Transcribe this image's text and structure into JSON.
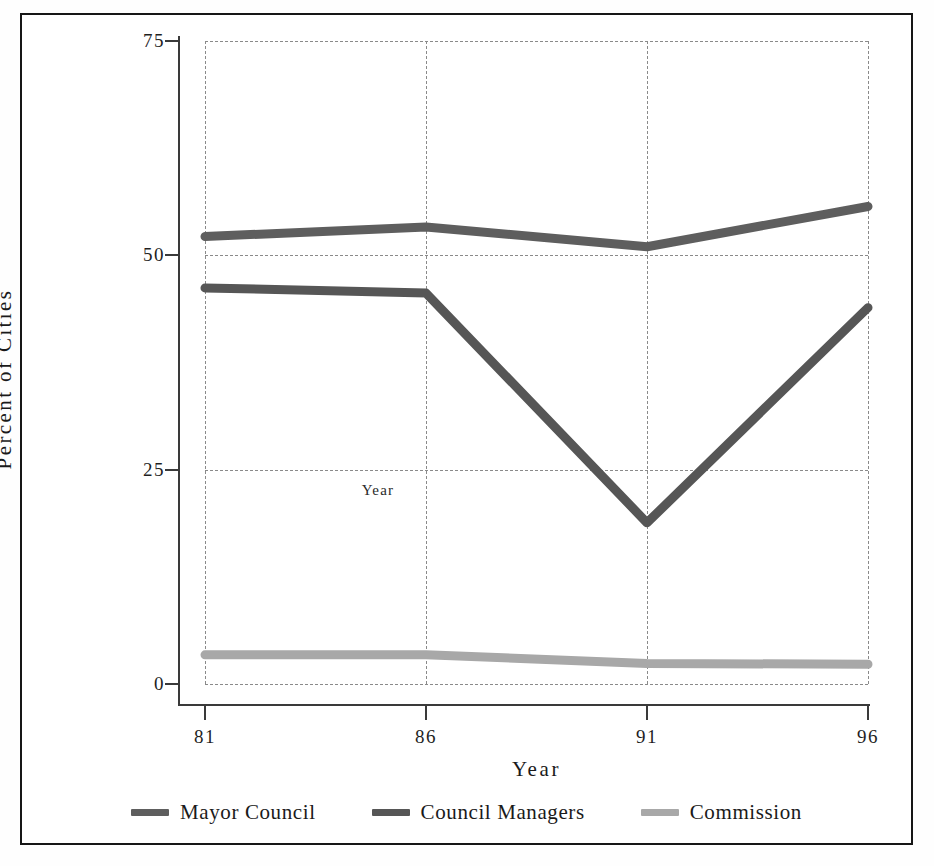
{
  "chart_data": {
    "type": "line",
    "title": "",
    "xlabel": "Year",
    "ylabel": "Percent of Cities",
    "categories": [
      "81",
      "86",
      "91",
      "96"
    ],
    "x": [
      81,
      86,
      91,
      96
    ],
    "xlim": [
      81,
      96
    ],
    "ylim": [
      0,
      75
    ],
    "yticks": [
      0,
      25,
      50,
      75
    ],
    "xticks": [
      81,
      86,
      91,
      96
    ],
    "grid": true,
    "legend_position": "bottom",
    "annotation": "Year",
    "series": [
      {
        "name": "Mayor Council",
        "color": "#5e5e5e",
        "values": [
          52.2,
          53.3,
          51.0,
          55.7
        ]
      },
      {
        "name": "Council Managers",
        "color": "#565656",
        "values": [
          46.2,
          45.6,
          18.8,
          43.9
        ]
      },
      {
        "name": "Commission",
        "color": "#a8a8a8",
        "values": [
          3.4,
          3.4,
          2.4,
          2.3
        ]
      }
    ]
  },
  "axes": {
    "y_tick_labels": [
      "75",
      "50",
      "25",
      "0"
    ],
    "x_tick_labels": [
      "81",
      "86",
      "91",
      "96"
    ],
    "y_title": "Percent of Cities",
    "x_title": "Year"
  },
  "plot_note": {
    "text": "Year"
  },
  "legend": {
    "items": [
      {
        "label": "Mayor Council",
        "color": "#5e5e5e"
      },
      {
        "label": "Council Managers",
        "color": "#565656"
      },
      {
        "label": "Commission",
        "color": "#a8a8a8"
      }
    ]
  },
  "colors": {
    "frame": "#161616",
    "axis": "#3a3a3a",
    "grid": "#8a8a8a",
    "background": "#ffffff"
  }
}
